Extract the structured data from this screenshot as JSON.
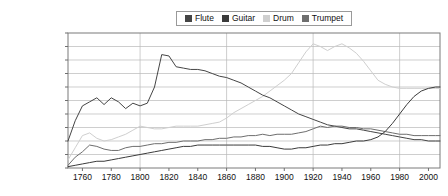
{
  "chart_data": {
    "type": "line",
    "title": "",
    "xlabel": "",
    "ylabel": "",
    "grid": true,
    "legend_position": "top-center",
    "xlim": [
      1750,
      2008
    ],
    "ylim": [
      0,
      0.001
    ],
    "x_tick_labels": [
      "1760",
      "1780",
      "1800",
      "1820",
      "1840",
      "1860",
      "1880",
      "1900",
      "1920",
      "1940",
      "1960",
      "1980",
      "2000"
    ],
    "x_ticks": [
      1760,
      1780,
      1800,
      1820,
      1840,
      1860,
      1880,
      1900,
      1920,
      1940,
      1960,
      1980,
      2000
    ],
    "y_tick_labels": [
      "0.00100%",
      "0.00090%",
      "0.00080%",
      "0.00070%",
      "0.00060%",
      "0.00050%",
      "0.00040%",
      "0.00030%",
      "0.00020%",
      "0.00010%",
      "0.00000%"
    ],
    "y_ticks": [
      0.001,
      0.0009,
      0.0008,
      0.0007,
      0.0006,
      0.0005,
      0.0004,
      0.0003,
      0.0002,
      0.0001,
      0
    ],
    "legend": [
      "Flute",
      "Guitar",
      "Drum",
      "Trumpet"
    ],
    "colors": {
      "Flute": "#454545",
      "Guitar": "#3b3b3b",
      "Drum": "#cfcfcf",
      "Trumpet": "#6e6e6e"
    },
    "x": [
      1750,
      1755,
      1760,
      1765,
      1770,
      1775,
      1780,
      1785,
      1790,
      1795,
      1800,
      1805,
      1810,
      1815,
      1820,
      1825,
      1830,
      1835,
      1840,
      1845,
      1850,
      1855,
      1860,
      1865,
      1870,
      1875,
      1880,
      1885,
      1890,
      1895,
      1900,
      1905,
      1910,
      1915,
      1920,
      1925,
      1930,
      1935,
      1940,
      1945,
      1950,
      1955,
      1960,
      1965,
      1970,
      1975,
      1980,
      1985,
      1990,
      1995,
      2000,
      2005,
      2008
    ],
    "series": [
      {
        "name": "Flute",
        "color": "#454545",
        "values": [
          0.0002,
          0.00035,
          0.00046,
          0.00049,
          0.00052,
          0.00047,
          0.00052,
          0.00049,
          0.00044,
          0.00048,
          0.00046,
          0.00048,
          0.0006,
          0.00084,
          0.00083,
          0.00075,
          0.00074,
          0.00073,
          0.00073,
          0.00072,
          0.0007,
          0.00068,
          0.00067,
          0.00065,
          0.00063,
          0.0006,
          0.00057,
          0.00054,
          0.00052,
          0.00049,
          0.00046,
          0.00043,
          0.0004,
          0.00038,
          0.00036,
          0.00034,
          0.00032,
          0.00031,
          0.0003,
          0.00029,
          0.00029,
          0.00028,
          0.00027,
          0.00026,
          0.00025,
          0.00024,
          0.00023,
          0.00022,
          0.00021,
          0.00021,
          0.0002,
          0.0002,
          0.0002
        ]
      },
      {
        "name": "Guitar",
        "color": "#3b3b3b",
        "values": [
          1e-05,
          2e-05,
          3e-05,
          4e-05,
          5e-05,
          5e-05,
          6e-05,
          7e-05,
          8e-05,
          9e-05,
          0.0001,
          0.00011,
          0.00012,
          0.00013,
          0.00014,
          0.00015,
          0.00016,
          0.00016,
          0.00017,
          0.00017,
          0.00017,
          0.00017,
          0.00017,
          0.00017,
          0.00017,
          0.00017,
          0.00017,
          0.00016,
          0.00016,
          0.00015,
          0.00014,
          0.00014,
          0.00015,
          0.00015,
          0.00016,
          0.00017,
          0.00017,
          0.00018,
          0.00018,
          0.00019,
          0.0002,
          0.0002,
          0.00021,
          0.00023,
          0.00027,
          0.00033,
          0.0004,
          0.00047,
          0.00053,
          0.00057,
          0.00059,
          0.0006,
          0.0006
        ]
      },
      {
        "name": "Drum",
        "color": "#cfcfcf",
        "values": [
          6e-05,
          0.00015,
          0.00024,
          0.00026,
          0.00022,
          0.0002,
          0.00021,
          0.00023,
          0.00025,
          0.00028,
          0.00031,
          0.0003,
          0.00029,
          0.00029,
          0.0003,
          0.00031,
          0.00031,
          0.00031,
          0.00031,
          0.00032,
          0.00033,
          0.00034,
          0.00037,
          0.00041,
          0.00044,
          0.00047,
          0.0005,
          0.00053,
          0.00057,
          0.00061,
          0.00065,
          0.0007,
          0.00078,
          0.00086,
          0.00092,
          0.0009,
          0.00087,
          0.0009,
          0.00092,
          0.00089,
          0.00085,
          0.00079,
          0.00072,
          0.00065,
          0.00062,
          0.0006,
          0.00059,
          0.00059,
          0.00059,
          0.00059,
          0.00059,
          0.00059,
          0.00059
        ]
      },
      {
        "name": "Trumpet",
        "color": "#6e6e6e",
        "values": [
          2e-05,
          8e-05,
          0.00012,
          0.00017,
          0.00016,
          0.00014,
          0.00013,
          0.00013,
          0.00015,
          0.00016,
          0.00016,
          0.00017,
          0.00018,
          0.00018,
          0.00019,
          0.00019,
          0.0002,
          0.0002,
          0.0002,
          0.00021,
          0.00021,
          0.00022,
          0.00022,
          0.00023,
          0.00023,
          0.00024,
          0.00024,
          0.00025,
          0.00024,
          0.00025,
          0.00025,
          0.00025,
          0.00026,
          0.00027,
          0.00029,
          0.00031,
          0.0003,
          0.00031,
          0.00031,
          0.0003,
          0.0003,
          0.00029,
          0.00029,
          0.00028,
          0.00027,
          0.00026,
          0.00025,
          0.00025,
          0.00024,
          0.00024,
          0.00024,
          0.00024,
          0.00024
        ]
      }
    ]
  }
}
